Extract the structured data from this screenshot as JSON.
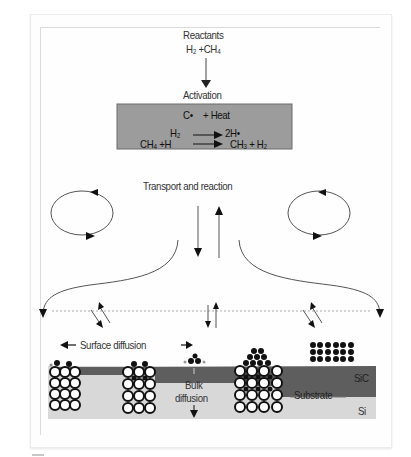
{
  "diagram": {
    "reactants": {
      "title": "Reactants",
      "formula": "H₂ +CH₄"
    },
    "activation": {
      "title": "Activation",
      "box_color": "#9a9a9a",
      "lines": [
        {
          "left": "C•",
          "right": "+ Heat"
        },
        {
          "left": "H₂",
          "arrow": "→",
          "right": "2H•"
        },
        {
          "left": "CH₄ +H",
          "arrow": "→",
          "right": "CH₃ + H₂"
        }
      ]
    },
    "transport": {
      "title": "Transport and reaction"
    },
    "surface": {
      "surface_diffusion_label": "Surface diffusion",
      "bulk_diffusion_label_1": "Bulk",
      "bulk_diffusion_label_2": "diffusion",
      "sic_label": "SiC",
      "substrate_label": "Substrate",
      "si_label": "Si",
      "colors": {
        "sic_layer": "#5e5e5e",
        "si_substrate": "#d6d6d6",
        "atom_outline": "#111111",
        "adatom": "#111111"
      }
    }
  }
}
